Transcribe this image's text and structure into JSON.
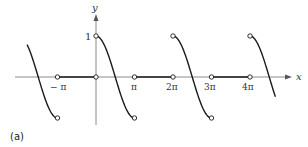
{
  "figure": {
    "caption": "(a)",
    "axis_x_label": "x",
    "axis_y_label": "y",
    "y_tick_label": "1",
    "x_ticks": [
      {
        "label": "− π",
        "value": -1
      },
      {
        "label": "π",
        "value": 1
      },
      {
        "label": "2π",
        "value": 2
      },
      {
        "label": "3π",
        "value": 3
      },
      {
        "label": "4π",
        "value": 4
      }
    ]
  },
  "function": {
    "description": "Periodic piecewise function with period 2π: f(x) = cos x on (0, π), f(x) = 0 on (π, 2π); open circles at endpoints",
    "pieces": [
      {
        "type": "cos",
        "from_pi": -1.79,
        "to_pi": -1,
        "open_end": true
      },
      {
        "type": "zero",
        "from_pi": -1,
        "to_pi": 0,
        "open_start": true,
        "open_end": true
      },
      {
        "type": "cos",
        "from_pi": 0,
        "to_pi": 1,
        "open_start": true,
        "open_end": true
      },
      {
        "type": "zero",
        "from_pi": 1,
        "to_pi": 2,
        "open_start": true,
        "open_end": true
      },
      {
        "type": "cos",
        "from_pi": 2,
        "to_pi": 3,
        "open_start": true,
        "open_end": true
      },
      {
        "type": "zero",
        "from_pi": 3,
        "to_pi": 4,
        "open_start": true,
        "open_end": true
      },
      {
        "type": "cos",
        "from_pi": 4,
        "to_pi": 4.66,
        "open_start": true
      }
    ]
  },
  "colors": {
    "axis": "#8a8a8a",
    "curve": "#1a1a1a",
    "text": "#333333"
  }
}
